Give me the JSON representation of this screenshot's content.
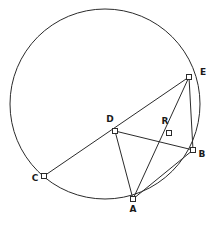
{
  "figure": {
    "background_color": "#ffffff",
    "stroke_color": "#2b2b2b",
    "label_color": "#1a1a1a",
    "marker_fill": "#ffffff",
    "circle": {
      "cx": 105,
      "cy": 104,
      "r": 95
    },
    "points": [
      {
        "id": "A",
        "label": "A",
        "x": 133,
        "y": 199,
        "label_x": 133,
        "label_y": 212
      },
      {
        "id": "B",
        "label": "B",
        "x": 193,
        "y": 150,
        "label_x": 202,
        "label_y": 157
      },
      {
        "id": "C",
        "label": "C",
        "x": 44,
        "y": 176,
        "label_x": 35,
        "label_y": 181
      },
      {
        "id": "D",
        "label": "D",
        "x": 115,
        "y": 131,
        "label_x": 110,
        "label_y": 122
      },
      {
        "id": "E",
        "label": "E",
        "x": 189,
        "y": 77,
        "label_x": 203,
        "label_y": 75
      },
      {
        "id": "R",
        "label": "R",
        "x": 169,
        "y": 133,
        "label_x": 165,
        "label_y": 124
      }
    ],
    "segments": [
      {
        "name": "C-E",
        "from": "C",
        "to": "E"
      },
      {
        "name": "D-A",
        "from": "D",
        "to": "A"
      },
      {
        "name": "D-B",
        "from": "D",
        "to": "B"
      },
      {
        "name": "A-E",
        "from": "A",
        "to": "E"
      },
      {
        "name": "A-B",
        "from": "A",
        "to": "B"
      },
      {
        "name": "E-B",
        "from": "E",
        "to": "B"
      }
    ]
  },
  "chart_data": {
    "type": "scatter",
    "xlabel": "",
    "ylabel": "",
    "points": [
      {
        "label": "A",
        "x": 133,
        "y": 199
      },
      {
        "label": "B",
        "x": 193,
        "y": 150
      },
      {
        "label": "C",
        "x": 44,
        "y": 176
      },
      {
        "label": "D",
        "x": 115,
        "y": 131
      },
      {
        "label": "E",
        "x": 189,
        "y": 77
      },
      {
        "label": "R",
        "x": 169,
        "y": 133
      }
    ],
    "annotations": [
      "A",
      "B",
      "C",
      "D",
      "E",
      "R"
    ]
  }
}
